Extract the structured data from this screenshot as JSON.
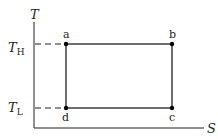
{
  "diagram": {
    "type": "T-S diagram (Carnot cycle)",
    "axes": {
      "y_label": "T",
      "x_label": "S"
    },
    "levels": {
      "high": {
        "symbol": "T",
        "subscript": "H"
      },
      "low": {
        "symbol": "T",
        "subscript": "L"
      }
    },
    "points": [
      {
        "id": "a",
        "label": "a"
      },
      {
        "id": "b",
        "label": "b"
      },
      {
        "id": "c",
        "label": "c"
      },
      {
        "id": "d",
        "label": "d"
      }
    ],
    "colors": {
      "axis": "#231f20",
      "cycle": "#6d6e71",
      "point": "#000000",
      "dash": "#231f20"
    }
  }
}
